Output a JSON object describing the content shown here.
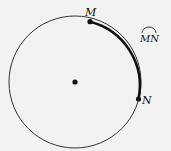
{
  "diagram": {
    "type": "circle-arc",
    "circle": {
      "cx": 75,
      "cy": 82,
      "r": 66,
      "stroke": "#222"
    },
    "center_point": {
      "x": 75,
      "y": 82
    },
    "points": [
      {
        "label": "M",
        "x": 90,
        "y": 21
      },
      {
        "label": "N",
        "x": 138,
        "y": 99
      }
    ],
    "highlighted_arc": {
      "from": "M",
      "to": "N",
      "stroke": "#111"
    },
    "arc_notation": {
      "text": "MN",
      "x": 148,
      "y": 40
    }
  }
}
